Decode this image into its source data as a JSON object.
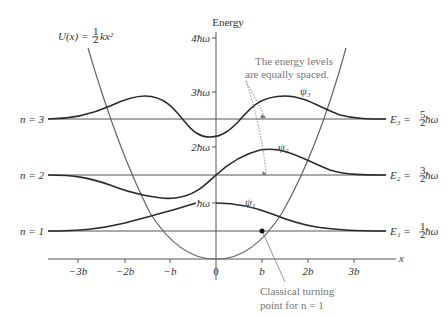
{
  "diagram": {
    "energy_axis_label": "Energy",
    "x_axis_label": "x",
    "potential_label": {
      "lhs": "U(x) = ",
      "frac": "1/2",
      "rhs": "kx²"
    },
    "energy_ticks": [
      {
        "label": "4ħω",
        "value": 4
      },
      {
        "label": "3ħω",
        "value": 3
      },
      {
        "label": "2ħω",
        "value": 2
      },
      {
        "label": "ħω",
        "value": 1
      }
    ],
    "x_ticks": [
      {
        "label": "−3b",
        "value": -3
      },
      {
        "label": "−2b",
        "value": -2
      },
      {
        "label": "−b",
        "value": -1
      },
      {
        "label": "0",
        "value": 0
      },
      {
        "label": "b",
        "value": 1
      },
      {
        "label": "2b",
        "value": 2
      },
      {
        "label": "3b",
        "value": 3
      }
    ],
    "levels": [
      {
        "n_label": "n = 3",
        "energy_label": "E₃ = ",
        "frac": "5/2",
        "unit": "ħω",
        "psi_label": "ψ₃",
        "energy": 2.5
      },
      {
        "n_label": "n = 2",
        "energy_label": "E₂ = ",
        "frac": "3/2",
        "unit": "ħω",
        "psi_label": "ψ₂",
        "energy": 1.5
      },
      {
        "n_label": "n = 1",
        "energy_label": "E₁ = ",
        "frac": "1/2",
        "unit": "ħω",
        "psi_label": "ψ₁",
        "energy": 0.5
      }
    ],
    "annotations": {
      "equal_spacing_line1": "The energy levels",
      "equal_spacing_line2": "are equally spaced.",
      "turning_point_line1": "Classical turning",
      "turning_point_line2": "point for n = 1"
    },
    "colors": {
      "curve": "#2a2a2a",
      "axis": "#555555",
      "annotation": "#888888",
      "potential": "#555555"
    }
  }
}
